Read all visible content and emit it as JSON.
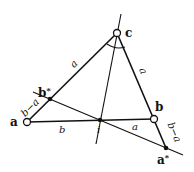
{
  "diagram": {
    "type": "geometry",
    "colors": {
      "stroke": "#111111",
      "background": "#ffffff"
    },
    "points": {
      "a": {
        "label": "a",
        "x": 27,
        "y": 122,
        "marker": "open-circle"
      },
      "b": {
        "label": "b",
        "x": 154,
        "y": 119,
        "marker": "open-circle"
      },
      "c": {
        "label": "c",
        "x": 117,
        "y": 33,
        "marker": "open-circle"
      },
      "b_star": {
        "label": "b*",
        "x": 50,
        "y": 99,
        "marker": "filled-dot"
      },
      "a_star": {
        "label": "a*",
        "x": 166,
        "y": 148,
        "marker": "filled-dot"
      },
      "i": {
        "label": "i",
        "x": 100,
        "y": 120,
        "marker": "filled-dot"
      }
    },
    "segment_labels": {
      "ca_upper": "a",
      "cb": "a",
      "a_bstar": "b−a",
      "a_i": "b",
      "i_b": "a",
      "b_astar": "b−a"
    },
    "vertex_labels": {
      "a": "a",
      "b": "b",
      "c": "c",
      "b_star": "b",
      "b_star_sup": "*",
      "a_star": "a",
      "a_star_sup": "*",
      "i": "i"
    }
  }
}
